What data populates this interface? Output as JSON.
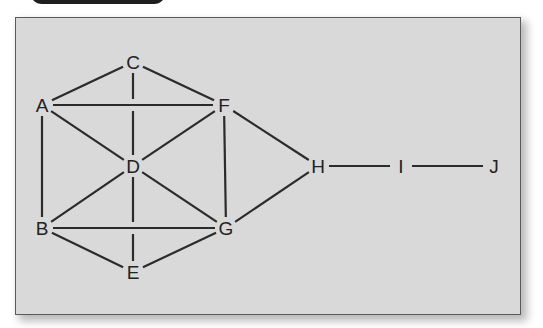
{
  "diagram": {
    "type": "undirected-graph",
    "colors": {
      "background": "#d9d9d9",
      "frame_border": "#5a5a5a",
      "edge": "#2b2b2b",
      "label": "#222222",
      "header_tab": "#1e1e1e"
    },
    "nodes": [
      {
        "id": "A",
        "label": "A",
        "x": 42,
        "y": 105
      },
      {
        "id": "B",
        "label": "B",
        "x": 42,
        "y": 228
      },
      {
        "id": "C",
        "label": "C",
        "x": 133,
        "y": 62
      },
      {
        "id": "D",
        "label": "D",
        "x": 133,
        "y": 166
      },
      {
        "id": "E",
        "label": "E",
        "x": 133,
        "y": 272
      },
      {
        "id": "F",
        "label": "F",
        "x": 224,
        "y": 105
      },
      {
        "id": "G",
        "label": "G",
        "x": 226,
        "y": 228
      },
      {
        "id": "H",
        "label": "H",
        "x": 318,
        "y": 166
      },
      {
        "id": "I",
        "label": "I",
        "x": 401,
        "y": 166
      },
      {
        "id": "J",
        "label": "J",
        "x": 494,
        "y": 166
      }
    ],
    "edges": [
      [
        "A",
        "C"
      ],
      [
        "C",
        "F"
      ],
      [
        "A",
        "F"
      ],
      [
        "C",
        "D"
      ],
      [
        "A",
        "B"
      ],
      [
        "A",
        "D"
      ],
      [
        "F",
        "D"
      ],
      [
        "F",
        "G"
      ],
      [
        "F",
        "H"
      ],
      [
        "B",
        "D"
      ],
      [
        "D",
        "G"
      ],
      [
        "D",
        "E"
      ],
      [
        "B",
        "G"
      ],
      [
        "B",
        "E"
      ],
      [
        "E",
        "G"
      ],
      [
        "G",
        "H"
      ],
      [
        "H",
        "I"
      ],
      [
        "I",
        "J"
      ]
    ]
  }
}
